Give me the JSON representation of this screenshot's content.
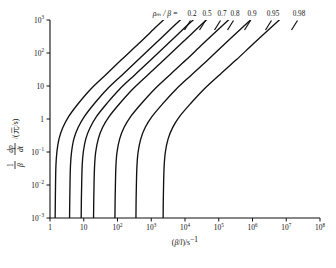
{
  "chart_data": {
    "type": "line",
    "title": "",
    "xlabel": "(β/l)/s⁻¹",
    "ylabel": "(1/β)(dp/dt)/(元/s)",
    "xscale": "log",
    "yscale": "log",
    "xlim": [
      1,
      100000000
    ],
    "ylim": [
      0.001,
      1000
    ],
    "grid": false,
    "legend_position": "top-right-inline",
    "legend_prefix": "ρₘ / β =",
    "x_ticks": [
      {
        "value": 1,
        "label": "1",
        "mantissa": "1",
        "exponent": ""
      },
      {
        "value": 10,
        "label": "10",
        "mantissa": "10",
        "exponent": ""
      },
      {
        "value": 100,
        "label": "10²",
        "mantissa": "10",
        "exponent": "2"
      },
      {
        "value": 1000,
        "label": "10³",
        "mantissa": "10",
        "exponent": "3"
      },
      {
        "value": 10000,
        "label": "10⁴",
        "mantissa": "10",
        "exponent": "4"
      },
      {
        "value": 100000,
        "label": "10⁵",
        "mantissa": "10",
        "exponent": "5"
      },
      {
        "value": 1000000,
        "label": "10⁶",
        "mantissa": "10",
        "exponent": "6"
      },
      {
        "value": 10000000,
        "label": "10⁷",
        "mantissa": "10",
        "exponent": "7"
      },
      {
        "value": 100000000,
        "label": "10⁸",
        "mantissa": "10",
        "exponent": "8"
      }
    ],
    "y_ticks": [
      {
        "value": 1000,
        "label": "10³",
        "mantissa": "10",
        "exponent": "3"
      },
      {
        "value": 100,
        "label": "10²",
        "mantissa": "10",
        "exponent": "2"
      },
      {
        "value": 10,
        "label": "10",
        "mantissa": "10",
        "exponent": ""
      },
      {
        "value": 1,
        "label": "1",
        "mantissa": "1",
        "exponent": ""
      },
      {
        "value": 0.1,
        "label": "10⁻¹",
        "mantissa": "10",
        "exponent": "−1"
      },
      {
        "value": 0.01,
        "label": "10⁻²",
        "mantissa": "10",
        "exponent": "−2"
      },
      {
        "value": 0.001,
        "label": "10⁻³",
        "mantissa": "10",
        "exponent": "−3"
      }
    ],
    "series": [
      {
        "name": "0.2",
        "label": "0.2",
        "asymptote_x": 1.45,
        "points": [
          [
            1.42,
            0.001
          ],
          [
            1.44,
            0.0035
          ],
          [
            1.46,
            0.012
          ],
          [
            1.5,
            0.04
          ],
          [
            1.6,
            0.1
          ],
          [
            1.85,
            0.25
          ],
          [
            2.4,
            0.55
          ],
          [
            3.6,
            1.2
          ],
          [
            7.0,
            3.0
          ],
          [
            16,
            8.0
          ],
          [
            45,
            22
          ],
          [
            130,
            62
          ],
          [
            420,
            190
          ],
          [
            1400,
            620
          ],
          [
            3000,
            1300
          ]
        ]
      },
      {
        "name": "0.5",
        "label": "0.5",
        "asymptote_x": 3.9,
        "points": [
          [
            3.8,
            0.001
          ],
          [
            3.85,
            0.0035
          ],
          [
            3.92,
            0.012
          ],
          [
            4.05,
            0.04
          ],
          [
            4.35,
            0.1
          ],
          [
            5.1,
            0.25
          ],
          [
            6.8,
            0.55
          ],
          [
            10.5,
            1.2
          ],
          [
            21,
            3.0
          ],
          [
            49,
            8.0
          ],
          [
            140,
            22
          ],
          [
            410,
            62
          ],
          [
            1300,
            190
          ],
          [
            4400,
            620
          ],
          [
            9500,
            1300
          ]
        ]
      },
      {
        "name": "0.7",
        "label": "0.7",
        "asymptote_x": 8.6,
        "points": [
          [
            8.4,
            0.001
          ],
          [
            8.5,
            0.0035
          ],
          [
            8.7,
            0.012
          ],
          [
            9.0,
            0.04
          ],
          [
            9.7,
            0.1
          ],
          [
            11.5,
            0.25
          ],
          [
            15.5,
            0.55
          ],
          [
            24,
            1.2
          ],
          [
            49,
            3.0
          ],
          [
            115,
            8.0
          ],
          [
            330,
            22
          ],
          [
            980,
            62
          ],
          [
            3100,
            190
          ],
          [
            10500,
            620
          ],
          [
            23000,
            1300
          ]
        ]
      },
      {
        "name": "0.8",
        "label": "0.8",
        "asymptote_x": 20,
        "points": [
          [
            19.5,
            0.001
          ],
          [
            19.8,
            0.0035
          ],
          [
            20.2,
            0.012
          ],
          [
            21,
            0.04
          ],
          [
            22.6,
            0.1
          ],
          [
            27,
            0.25
          ],
          [
            36,
            0.55
          ],
          [
            57,
            1.2
          ],
          [
            118,
            3.0
          ],
          [
            280,
            8.0
          ],
          [
            800,
            22
          ],
          [
            2400,
            62
          ],
          [
            7600,
            190
          ],
          [
            26000,
            620
          ],
          [
            56000,
            1300
          ]
        ]
      },
      {
        "name": "0.9",
        "label": "0.9",
        "asymptote_x": 86,
        "points": [
          [
            84,
            0.001
          ],
          [
            85,
            0.0035
          ],
          [
            87,
            0.012
          ],
          [
            90,
            0.04
          ],
          [
            97,
            0.1
          ],
          [
            116,
            0.25
          ],
          [
            156,
            0.55
          ],
          [
            248,
            1.2
          ],
          [
            520,
            3.0
          ],
          [
            1250,
            8.0
          ],
          [
            3600,
            22
          ],
          [
            10800,
            62
          ],
          [
            34000,
            190
          ],
          [
            118000,
            620
          ],
          [
            255000,
            1300
          ]
        ]
      },
      {
        "name": "0.95",
        "label": "0.95",
        "asymptote_x": 360,
        "points": [
          [
            352,
            0.001
          ],
          [
            356,
            0.0035
          ],
          [
            364,
            0.012
          ],
          [
            378,
            0.04
          ],
          [
            408,
            0.1
          ],
          [
            490,
            0.25
          ],
          [
            660,
            0.55
          ],
          [
            1060,
            1.2
          ],
          [
            2250,
            3.0
          ],
          [
            5450,
            8.0
          ],
          [
            15800,
            22
          ],
          [
            48000,
            62
          ],
          [
            152000,
            190
          ],
          [
            530000,
            620
          ],
          [
            1150000,
            1300
          ]
        ]
      },
      {
        "name": "0.98",
        "label": "0.98",
        "asymptote_x": 2300,
        "points": [
          [
            2250,
            0.001
          ],
          [
            2275,
            0.0035
          ],
          [
            2325,
            0.012
          ],
          [
            2420,
            0.04
          ],
          [
            2620,
            0.1
          ],
          [
            3160,
            0.25
          ],
          [
            4300,
            0.55
          ],
          [
            6950,
            1.2
          ],
          [
            14900,
            3.0
          ],
          [
            36500,
            8.0
          ],
          [
            107000,
            22
          ],
          [
            330000,
            62
          ],
          [
            1060000,
            190
          ],
          [
            3750000,
            620
          ],
          [
            8200000,
            1300
          ]
        ]
      }
    ]
  },
  "caption": {
    "text": ""
  }
}
